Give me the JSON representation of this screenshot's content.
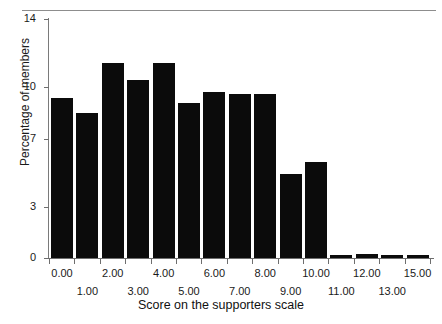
{
  "figure": {
    "top_ghost_text": "",
    "x_axis_title": "Score on the supporters scale",
    "y_axis_title": "Percentage of members"
  },
  "chart_data": {
    "type": "bar",
    "title": "",
    "subtitle": "",
    "xlabel": "Score on the supporters scale",
    "ylabel": "Percentage of members",
    "categories": [
      "0.00",
      "1.00",
      "2.00",
      "3.00",
      "4.00",
      "5.00",
      "6.00",
      "7.00",
      "8.00",
      "9.00",
      "10.00",
      "11.00",
      "12.00",
      "13.00",
      "15.00"
    ],
    "values": [
      9.4,
      8.5,
      11.4,
      10.4,
      11.4,
      9.1,
      9.7,
      9.6,
      9.6,
      4.9,
      5.6,
      0.15,
      0.25,
      0.15,
      0.15
    ],
    "series": [
      {
        "name": "Percentage of members",
        "values": [
          9.4,
          8.5,
          11.4,
          10.4,
          11.4,
          9.1,
          9.7,
          9.6,
          9.6,
          4.9,
          5.6,
          0.15,
          0.25,
          0.15,
          0.15
        ]
      }
    ],
    "ylim": [
      0,
      14
    ],
    "yticks": [
      0,
      3,
      7,
      10,
      14
    ],
    "ytick_labels": [
      "0",
      "3",
      "7",
      "10",
      "14"
    ],
    "xtick_labels_upper": [
      "0.00",
      "2.00",
      "4.00",
      "6.00",
      "8.00",
      "10.00",
      "12.00",
      "15.00"
    ],
    "xtick_labels_lower": [
      "1.00",
      "3.00",
      "5.00",
      "7.00",
      "9.00",
      "11.00",
      "13.00"
    ],
    "grid": false,
    "legend": null,
    "legend_position": "none",
    "bar_color": "#0b0b0b",
    "background_color": "#ffffff",
    "annotations": []
  }
}
